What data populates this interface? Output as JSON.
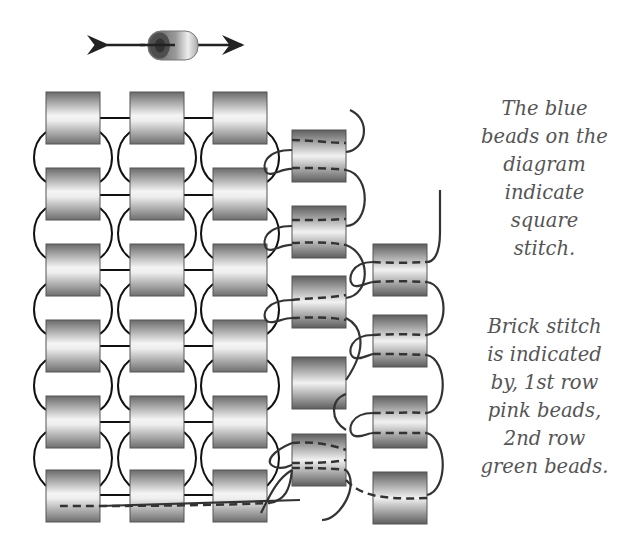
{
  "figure": {
    "type": "beadwork stitch diagram",
    "legend_icon": "bead-with-bidirectional-arrow",
    "square_stitch_grid": {
      "columns": 3,
      "rows": 6
    },
    "brick_stitch_row1_beads": 5,
    "brick_stitch_row2_beads": 4,
    "colors": {
      "bead_dark": "#6e6e6e",
      "bead_light": "#f2f2f2",
      "thread": "#222222",
      "caption_text": "#555555"
    }
  },
  "captions": {
    "square_stitch": [
      "The blue",
      "beads on the",
      "diagram",
      "indicate",
      "square",
      "stitch."
    ],
    "brick_stitch": [
      "Brick stitch",
      "is indicated",
      "by, 1st row",
      "pink beads,",
      "2nd row",
      "green beads."
    ]
  }
}
